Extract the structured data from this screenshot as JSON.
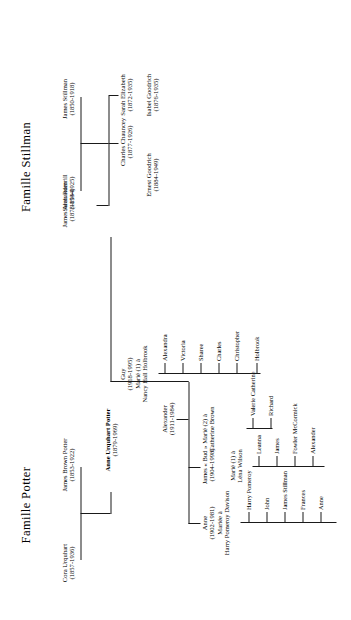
{
  "chart": {
    "type": "genealogy-tree",
    "orientation": "rotated-90",
    "titles": {
      "potter": "Famille Potter",
      "stillman": "Famille Stillman"
    }
  },
  "potter": {
    "father": {
      "name": "James Brown Potter",
      "dates": "(1853-1922)"
    },
    "mother": {
      "name": "Cora Urquhart",
      "dates": "(1857-1936)"
    },
    "child": {
      "name": "Anne Urquhart Potter",
      "dates": "(1879-1969)",
      "bold": true
    }
  },
  "stillman": {
    "father": {
      "name": "James Stillman",
      "dates": "(1850-1918)"
    },
    "mother": {
      "name": "Sarah Rumrill",
      "dates": "(1853-1925)"
    },
    "children": [
      {
        "name": "Sarah Elizabeth",
        "dates": "(1872-1935)"
      },
      {
        "name": "Charles Chauncey",
        "dates": "(1877-1926)"
      },
      {
        "name": "James Alexander",
        "dates": "(1873-1944)"
      }
    ],
    "spouses": [
      {
        "name": "Isabel Goodrich",
        "dates": "(1876-1935)"
      },
      {
        "name": "Ernest Goodrich",
        "dates": "(1884-1949)"
      }
    ]
  },
  "generation3": [
    {
      "name": "Anne",
      "dates": "(1902-1981)",
      "marriage_label": "Mariée à",
      "spouse": "Harry Pomeroy Davison",
      "children": [
        "Harry Pomeroy",
        "John",
        "James Stillman",
        "Frances",
        "Anne"
      ]
    },
    {
      "name": "James « Bud »",
      "dates": "(1904-1998)",
      "marriages": [
        {
          "label": "Marié (1) à",
          "spouse": "Léna Wilson",
          "children": [
            "Leanna",
            "James",
            "Fowler McCormick",
            "Alexander"
          ]
        },
        {
          "label": "Marié (2) à",
          "spouse": "Catherine Brown",
          "children": [
            "Valerie Catherine",
            "Richard"
          ]
        }
      ]
    },
    {
      "name": "Alexander",
      "dates": "(1911-1984)",
      "children": []
    },
    {
      "name": "Guy",
      "dates": "(1918-1995)",
      "marriage_label": "Marié (1) à",
      "spouse": "Nancy Hall Holbrook",
      "children": [
        "Alexandra",
        "Victoria",
        "Sharee",
        "Charles",
        "Christopher",
        "Holbrook"
      ]
    }
  ]
}
